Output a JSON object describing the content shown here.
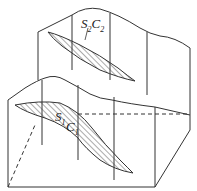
{
  "diagram": {
    "type": "geological block diagram",
    "labels": {
      "upper": {
        "s": "S",
        "s_sub": "2",
        "c": "C",
        "c_sub": "2"
      },
      "lower": {
        "s": "S",
        "s_sub": "1",
        "c": "C",
        "c_sub": "1"
      }
    },
    "colors": {
      "line": "#333333",
      "hatch": "#444444",
      "background": "#ffffff"
    }
  }
}
